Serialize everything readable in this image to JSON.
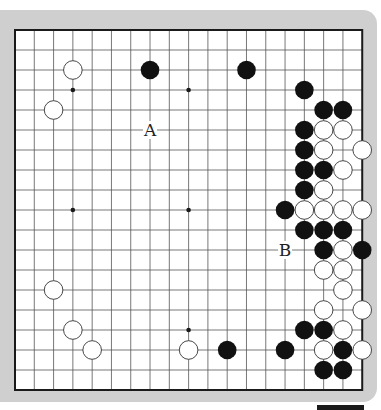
{
  "board": {
    "size": 19,
    "origin_x": 15,
    "origin_y": 30,
    "step_x": 19.29,
    "step_y": 20,
    "stone_radius": 9.3,
    "colors": {
      "frame": "#cfcfcf",
      "board": "#ffffff",
      "line": "#555555",
      "border": "#1a1a1a",
      "black_stone": "#111111",
      "white_stone": "#ffffff",
      "white_outline": "#333333"
    },
    "hoshi": [
      [
        3,
        3
      ],
      [
        9,
        3
      ],
      [
        3,
        9
      ],
      [
        9,
        9
      ],
      [
        3,
        15
      ],
      [
        9,
        15
      ],
      [
        15,
        3
      ],
      [
        15,
        9
      ],
      [
        15,
        15
      ]
    ],
    "stones": {
      "black": [
        [
          7,
          2
        ],
        [
          12,
          2
        ],
        [
          15,
          3
        ],
        [
          16,
          4
        ],
        [
          17,
          4
        ],
        [
          15,
          5
        ],
        [
          15,
          6
        ],
        [
          15,
          7
        ],
        [
          16,
          7
        ],
        [
          15,
          8
        ],
        [
          14,
          9
        ],
        [
          15,
          10
        ],
        [
          16,
          10
        ],
        [
          17,
          10
        ],
        [
          16,
          11
        ],
        [
          18,
          11
        ],
        [
          15,
          15
        ],
        [
          16,
          15
        ],
        [
          11,
          16
        ],
        [
          14,
          16
        ],
        [
          17,
          16
        ],
        [
          16,
          17
        ],
        [
          17,
          17
        ]
      ],
      "white": [
        [
          3,
          2
        ],
        [
          2,
          4
        ],
        [
          16,
          5
        ],
        [
          17,
          5
        ],
        [
          16,
          6
        ],
        [
          18,
          6
        ],
        [
          17,
          7
        ],
        [
          16,
          8
        ],
        [
          15,
          9
        ],
        [
          16,
          9
        ],
        [
          17,
          9
        ],
        [
          18,
          9
        ],
        [
          17,
          11
        ],
        [
          16,
          12
        ],
        [
          17,
          12
        ],
        [
          17,
          13
        ],
        [
          2,
          13
        ],
        [
          16,
          14
        ],
        [
          18,
          14
        ],
        [
          3,
          15
        ],
        [
          17,
          15
        ],
        [
          4,
          16
        ],
        [
          9,
          16
        ],
        [
          16,
          16
        ],
        [
          18,
          16
        ]
      ]
    },
    "labels": [
      {
        "text": "A",
        "col": 7,
        "row": 5
      },
      {
        "text": "B",
        "col": 14,
        "row": 11
      }
    ]
  }
}
